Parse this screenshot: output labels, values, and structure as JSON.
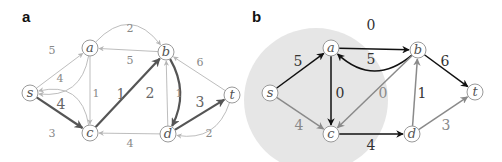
{
  "panels": [
    {
      "label": "a",
      "nodes": [
        {
          "id": "s",
          "label": "s"
        },
        {
          "id": "a",
          "label": "a"
        },
        {
          "id": "b",
          "label": "b"
        },
        {
          "id": "c",
          "label": "c"
        },
        {
          "id": "d",
          "label": "d"
        },
        {
          "id": "t",
          "label": "t"
        }
      ],
      "edges": [
        {
          "from": "a",
          "to": "s",
          "weight": "5",
          "style": "light",
          "curved": true
        },
        {
          "from": "s",
          "to": "a",
          "weight": "4",
          "style": "light",
          "curved": false
        },
        {
          "from": "a",
          "to": "b",
          "weight": "2",
          "style": "light",
          "curved": true
        },
        {
          "from": "b",
          "to": "a",
          "weight": "5",
          "style": "light",
          "curved": false
        },
        {
          "from": "a",
          "to": "c",
          "weight": "1",
          "style": "light",
          "curved": false
        },
        {
          "from": "s",
          "to": "c",
          "weight": "4",
          "style": "bold",
          "curved": false
        },
        {
          "from": "c",
          "to": "s",
          "weight": "3",
          "style": "light",
          "curved": true
        },
        {
          "from": "c",
          "to": "b",
          "weight": "1",
          "style": "bold",
          "curved": false
        },
        {
          "from": "b",
          "to": "d",
          "weight": "2",
          "style": "bold",
          "curved": true
        },
        {
          "from": "d",
          "to": "b",
          "weight": "1",
          "style": "light",
          "curved": false
        },
        {
          "from": "t",
          "to": "b",
          "weight": "6",
          "style": "light",
          "curved": false
        },
        {
          "from": "d",
          "to": "t",
          "weight": "3",
          "style": "bold",
          "curved": false
        },
        {
          "from": "t",
          "to": "d",
          "weight": "2",
          "style": "light",
          "curved": true
        },
        {
          "from": "d",
          "to": "c",
          "weight": "4",
          "style": "light",
          "curved": false
        }
      ]
    },
    {
      "label": "b",
      "nodes": [
        {
          "id": "s",
          "label": "s"
        },
        {
          "id": "a",
          "label": "a"
        },
        {
          "id": "b",
          "label": "b"
        },
        {
          "id": "c",
          "label": "c"
        },
        {
          "id": "d",
          "label": "d"
        },
        {
          "id": "t",
          "label": "t"
        }
      ],
      "edges": [
        {
          "from": "s",
          "to": "a",
          "weight": "5",
          "style": "dark",
          "curved": false
        },
        {
          "from": "s",
          "to": "c",
          "weight": "4",
          "style": "gray",
          "curved": false
        },
        {
          "from": "a",
          "to": "b",
          "weight": "5",
          "style": "dark",
          "curved": false
        },
        {
          "from": "b",
          "to": "a",
          "weight": "0",
          "style": "dark",
          "curved": true
        },
        {
          "from": "a",
          "to": "c",
          "weight": "0",
          "style": "dark",
          "curved": false
        },
        {
          "from": "b",
          "to": "c",
          "weight": "0",
          "style": "gray",
          "curved": false
        },
        {
          "from": "b",
          "to": "t",
          "weight": "6",
          "style": "dark",
          "curved": false
        },
        {
          "from": "c",
          "to": "d",
          "weight": "4",
          "style": "dark",
          "curved": false
        },
        {
          "from": "d",
          "to": "b",
          "weight": "1",
          "style": "gray",
          "curved": false
        },
        {
          "from": "d",
          "to": "t",
          "weight": "3",
          "style": "gray",
          "curved": false
        }
      ],
      "shaded_region": {
        "contains": [
          "s",
          "a",
          "c"
        ],
        "color": "#e6e6e6"
      }
    }
  ],
  "colors": {
    "light_edge": "#b5b5b5",
    "bold_edge": "#555555",
    "dark_edge": "#111111",
    "gray_edge": "#8a8a8a"
  }
}
